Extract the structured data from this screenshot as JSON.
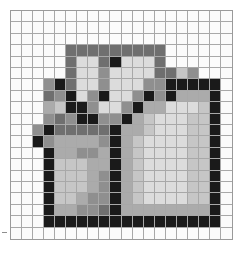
{
  "figure": {
    "type": "pixel-grid-mosaic",
    "title": "",
    "columns": 20,
    "rows": 20,
    "cell_size_px": 11.15,
    "grid_line_color": "#a8a8a8",
    "background_color": "#fbfbfb",
    "border_color": "#9a9a9a",
    "palette": {
      "0": "#fbfbfb",
      "1": "#ededed",
      "2": "#dcdcdc",
      "3": "#c6c6c6",
      "4": "#ababab",
      "5": "#8f8f8f",
      "6": "#6f6f6f",
      "7": "#4f4f4f",
      "8": "#1a1a1a"
    },
    "palette_names": {
      "0": "white",
      "1": "near-white",
      "2": "light-gray",
      "3": "light-mid-gray",
      "4": "mid-gray",
      "5": "gray",
      "6": "dark-gray",
      "7": "darker-gray",
      "8": "black"
    },
    "pixels": [
      [
        0,
        0,
        0,
        0,
        0,
        0,
        0,
        0,
        0,
        0,
        0,
        0,
        0,
        0,
        0,
        0,
        0,
        0,
        0,
        0
      ],
      [
        0,
        0,
        0,
        0,
        0,
        0,
        0,
        0,
        0,
        0,
        0,
        0,
        0,
        0,
        0,
        0,
        0,
        0,
        0,
        0
      ],
      [
        0,
        0,
        0,
        0,
        0,
        0,
        0,
        0,
        0,
        0,
        0,
        0,
        0,
        0,
        0,
        0,
        0,
        0,
        0,
        0
      ],
      [
        0,
        0,
        0,
        0,
        0,
        6,
        6,
        6,
        6,
        6,
        6,
        6,
        6,
        6,
        0,
        0,
        0,
        0,
        0,
        0
      ],
      [
        0,
        0,
        0,
        0,
        0,
        6,
        2,
        2,
        6,
        8,
        2,
        2,
        2,
        6,
        0,
        0,
        0,
        0,
        0,
        0
      ],
      [
        0,
        0,
        0,
        0,
        0,
        6,
        2,
        2,
        5,
        2,
        2,
        2,
        2,
        6,
        6,
        3,
        5,
        0,
        0,
        0
      ],
      [
        0,
        0,
        0,
        5,
        8,
        6,
        2,
        2,
        5,
        2,
        2,
        2,
        5,
        5,
        8,
        8,
        8,
        8,
        8,
        0
      ],
      [
        0,
        0,
        0,
        6,
        5,
        8,
        2,
        5,
        8,
        2,
        2,
        5,
        8,
        5,
        8,
        4,
        4,
        4,
        8,
        0
      ],
      [
        0,
        0,
        0,
        4,
        3,
        8,
        8,
        5,
        2,
        2,
        5,
        8,
        4,
        4,
        2,
        2,
        2,
        3,
        8,
        0
      ],
      [
        0,
        0,
        0,
        5,
        6,
        5,
        8,
        8,
        5,
        5,
        8,
        4,
        3,
        2,
        2,
        2,
        3,
        3,
        8,
        0
      ],
      [
        0,
        0,
        5,
        8,
        6,
        6,
        6,
        6,
        6,
        8,
        4,
        4,
        3,
        2,
        2,
        2,
        3,
        3,
        8,
        0
      ],
      [
        0,
        0,
        8,
        5,
        4,
        4,
        4,
        4,
        5,
        8,
        4,
        3,
        2,
        2,
        2,
        2,
        3,
        3,
        8,
        0
      ],
      [
        0,
        0,
        0,
        8,
        4,
        4,
        5,
        5,
        4,
        8,
        4,
        3,
        2,
        2,
        2,
        2,
        3,
        3,
        8,
        0
      ],
      [
        0,
        0,
        0,
        8,
        3,
        3,
        3,
        4,
        4,
        8,
        4,
        3,
        2,
        2,
        2,
        2,
        3,
        3,
        8,
        0
      ],
      [
        0,
        0,
        0,
        8,
        3,
        3,
        3,
        4,
        5,
        8,
        4,
        3,
        2,
        2,
        2,
        2,
        3,
        3,
        8,
        0
      ],
      [
        0,
        0,
        0,
        8,
        3,
        3,
        3,
        4,
        5,
        8,
        4,
        3,
        2,
        2,
        2,
        2,
        3,
        3,
        8,
        0
      ],
      [
        0,
        0,
        0,
        8,
        3,
        3,
        4,
        5,
        5,
        8,
        4,
        3,
        2,
        2,
        2,
        2,
        3,
        3,
        8,
        0
      ],
      [
        0,
        0,
        0,
        8,
        4,
        4,
        5,
        5,
        6,
        8,
        4,
        4,
        4,
        4,
        4,
        4,
        4,
        4,
        8,
        0
      ],
      [
        0,
        0,
        0,
        8,
        8,
        8,
        8,
        8,
        8,
        8,
        8,
        8,
        8,
        8,
        8,
        8,
        8,
        8,
        8,
        0
      ],
      [
        0,
        0,
        0,
        0,
        0,
        0,
        0,
        0,
        0,
        0,
        0,
        0,
        0,
        0,
        0,
        0,
        0,
        0,
        0,
        0
      ]
    ]
  }
}
